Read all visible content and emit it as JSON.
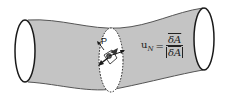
{
  "figure": {
    "point_label": "P",
    "formula": {
      "lhs": "u",
      "lhs_subscript": "N",
      "equals": "=",
      "numerator": "δA",
      "denominator": "|δA|"
    },
    "colors": {
      "tube_fill": "#c4c4c4",
      "outline": "#1a1a1a",
      "cross_section_fill": "#ffffff",
      "background": "#ffffff"
    }
  }
}
